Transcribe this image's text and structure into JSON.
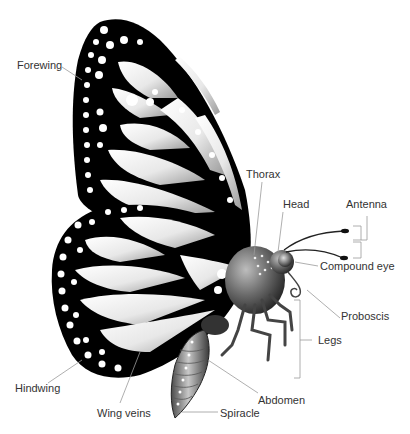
{
  "diagram": {
    "labels": {
      "forewing": "Forewing",
      "hindwing": "Hindwing",
      "wing_veins": "Wing veins",
      "thorax": "Thorax",
      "head": "Head",
      "antenna": "Antenna",
      "compound_eye": "Compound eye",
      "proboscis": "Proboscis",
      "legs": "Legs",
      "abdomen": "Abdomen",
      "spiracle": "Spiracle"
    },
    "colors": {
      "wing_border": "#000000",
      "wing_cell_light": "#ffffff",
      "wing_cell_shade": "#9a9a9a",
      "body": "#5a5a5a",
      "leader_line": "#9a9a9a",
      "label_text": "#333333"
    }
  }
}
